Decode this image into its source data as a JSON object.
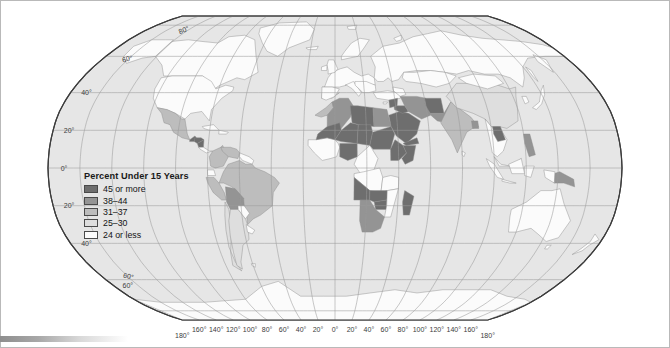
{
  "map": {
    "projection": "robinson",
    "title": "Percent Under 15 Years",
    "ocean_color": "#e6e6e6",
    "graticule_color": "#9a9a9a",
    "outline_color": "#3c3c3c",
    "border_color": "#8c8c8c"
  },
  "legend": {
    "title": "Percent Under 15 Years",
    "items": [
      {
        "label": "45 or more",
        "color": "#6e6e6e"
      },
      {
        "label": "38–44",
        "color": "#949494"
      },
      {
        "label": "31–37",
        "color": "#bdbdbd"
      },
      {
        "label": "25–30",
        "color": "#dedede"
      },
      {
        "label": "24 or less",
        "color": "#fbfbfb"
      }
    ]
  },
  "graticule": {
    "latitude_labels": [
      "80°",
      "60°",
      "40°",
      "20°",
      "0°",
      "20°",
      "40°",
      "60°"
    ],
    "longitude_labels": [
      "180°",
      "160°",
      "140°",
      "120°",
      "100°",
      "80°",
      "60°",
      "40°",
      "20°",
      "0°",
      "20°",
      "40°",
      "60°",
      "80°",
      "100°",
      "120°",
      "140°",
      "160°",
      "180°"
    ],
    "lat_interval_degrees": 20,
    "lon_interval_degrees": 20
  },
  "chart_data": {
    "type": "choropleth",
    "title": "Percent Under 15 Years",
    "unit": "percent of population under age 15",
    "classes": [
      {
        "label": "45 or more",
        "color": "#6e6e6e",
        "min": 45,
        "max": 100
      },
      {
        "label": "38–44",
        "color": "#949494",
        "min": 38,
        "max": 44
      },
      {
        "label": "31–37",
        "color": "#bdbdbd",
        "min": 31,
        "max": 37
      },
      {
        "label": "25–30",
        "color": "#dedede",
        "min": 25,
        "max": 30
      },
      {
        "label": "24 or less",
        "color": "#fbfbfb",
        "min": 0,
        "max": 24
      }
    ],
    "regions": [
      {
        "name": "Canada",
        "class": "24 or less"
      },
      {
        "name": "United States",
        "class": "24 or less"
      },
      {
        "name": "Greenland",
        "class": "24 or less"
      },
      {
        "name": "Mexico",
        "class": "31–37"
      },
      {
        "name": "Guatemala",
        "class": "45 or more"
      },
      {
        "name": "Honduras",
        "class": "45 or more"
      },
      {
        "name": "Nicaragua",
        "class": "45 or more"
      },
      {
        "name": "Cuba",
        "class": "24 or less"
      },
      {
        "name": "Venezuela",
        "class": "31–37"
      },
      {
        "name": "Colombia",
        "class": "31–37"
      },
      {
        "name": "Peru",
        "class": "31–37"
      },
      {
        "name": "Bolivia",
        "class": "38–44"
      },
      {
        "name": "Brazil",
        "class": "31–37"
      },
      {
        "name": "Argentina",
        "class": "25–30"
      },
      {
        "name": "Chile",
        "class": "25–30"
      },
      {
        "name": "Uruguay",
        "class": "24 or less"
      },
      {
        "name": "Europe",
        "class": "24 or less"
      },
      {
        "name": "Russia",
        "class": "24 or less"
      },
      {
        "name": "Morocco",
        "class": "31–37"
      },
      {
        "name": "Algeria",
        "class": "38–44"
      },
      {
        "name": "Libya",
        "class": "45 or more"
      },
      {
        "name": "Egypt",
        "class": "38–44"
      },
      {
        "name": "Mali",
        "class": "45 or more"
      },
      {
        "name": "Niger",
        "class": "45 or more"
      },
      {
        "name": "Chad",
        "class": "45 or more"
      },
      {
        "name": "Sudan",
        "class": "45 or more"
      },
      {
        "name": "Ethiopia",
        "class": "45 or more"
      },
      {
        "name": "Somalia",
        "class": "45 or more"
      },
      {
        "name": "Nigeria",
        "class": "45 or more"
      },
      {
        "name": "Dem. Rep. Congo",
        "class": "45 or more"
      },
      {
        "name": "Angola",
        "class": "45 or more"
      },
      {
        "name": "Zambia",
        "class": "45 or more"
      },
      {
        "name": "Zimbabwe",
        "class": "45 or more"
      },
      {
        "name": "Madagascar",
        "class": "45 or more"
      },
      {
        "name": "South Africa",
        "class": "38–44"
      },
      {
        "name": "Saudi Arabia",
        "class": "45 or more"
      },
      {
        "name": "Yemen",
        "class": "45 or more"
      },
      {
        "name": "Iraq",
        "class": "45 or more"
      },
      {
        "name": "Syria",
        "class": "45 or more"
      },
      {
        "name": "Iran",
        "class": "38–44"
      },
      {
        "name": "Afghanistan",
        "class": "45 or more"
      },
      {
        "name": "Pakistan",
        "class": "38–44"
      },
      {
        "name": "India",
        "class": "31–37"
      },
      {
        "name": "Bangladesh",
        "class": "38–44"
      },
      {
        "name": "China",
        "class": "25–30"
      },
      {
        "name": "Japan",
        "class": "24 or less"
      },
      {
        "name": "Indonesia",
        "class": "31–37"
      },
      {
        "name": "Philippines",
        "class": "38–44"
      },
      {
        "name": "Laos",
        "class": "45 or more"
      },
      {
        "name": "Papua New Guinea",
        "class": "38–44"
      },
      {
        "name": "Australia",
        "class": "24 or less"
      },
      {
        "name": "New Zealand",
        "class": "24 or less"
      },
      {
        "name": "Antarctica",
        "class": "24 or less"
      }
    ]
  }
}
